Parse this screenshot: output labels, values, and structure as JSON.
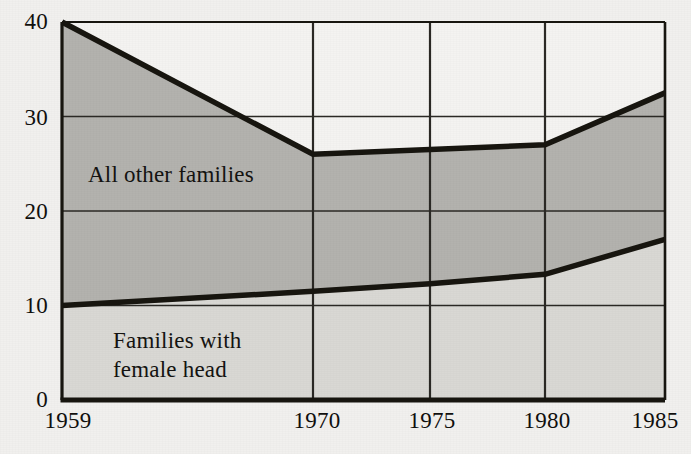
{
  "chart_data": {
    "type": "area",
    "title": "",
    "subtitle": "",
    "xlabel": "",
    "ylabel": "",
    "stacked": true,
    "grid": true,
    "legend_position": "inline-annotation",
    "x": [
      1959,
      1970,
      1975,
      1980,
      1985
    ],
    "categories": [
      "1959",
      "1970",
      "1975",
      "1980",
      "1985"
    ],
    "xtick_labels": [
      "1959",
      "1970",
      "1975",
      "1980",
      "1985"
    ],
    "ytick_labels": [
      "0",
      "10",
      "20",
      "30",
      "40"
    ],
    "ytick_values": [
      0,
      10,
      20,
      30,
      40
    ],
    "ylim": [
      0,
      40
    ],
    "xlim": [
      1959,
      1985
    ],
    "x_axis_nonlinear": true,
    "series": [
      {
        "name": "Families with female head",
        "label": "Families with\nfemale head",
        "label_line1": "Families with",
        "label_line2": "female head",
        "values": [
          10,
          11.5,
          12.3,
          13.3,
          17
        ],
        "cumulative_top": [
          10,
          11.5,
          12.3,
          13.3,
          17
        ],
        "fill": "#d9d8d4",
        "stack_order": 1
      },
      {
        "name": "All other families",
        "label": "All other families",
        "label_line1": "All other families",
        "label_line2": "",
        "values": [
          30,
          14.5,
          14.2,
          13.7,
          15.5
        ],
        "cumulative_top": [
          40,
          26,
          26.5,
          27,
          32.5
        ],
        "fill": "#b3b2ae",
        "stack_order": 2
      }
    ],
    "line_color": "#17150f",
    "grid_color": "#2b2925",
    "background": "#f1f0ee",
    "plot_background": "#f4f3f1"
  },
  "plot": {
    "left_px": 62,
    "right_px": 665,
    "top_px": 22,
    "bottom_px": 400,
    "x_pixels": [
      62,
      313,
      430,
      545,
      665
    ],
    "ytick_pixels": [
      400,
      306,
      212,
      118,
      22
    ]
  }
}
